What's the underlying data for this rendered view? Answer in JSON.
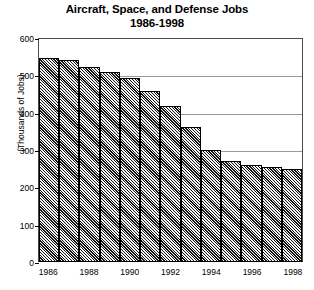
{
  "chart_data": {
    "type": "bar",
    "title": "Aircraft, Space, and Defense Jobs",
    "subtitle": "1986-1998",
    "xlabel": "",
    "ylabel": "(Thousands of Jobs)",
    "ylim": [
      0,
      600
    ],
    "ytick_values": [
      0,
      100,
      200,
      300,
      400,
      500,
      600
    ],
    "ytick_labels": [
      "0",
      "100",
      "200",
      "300",
      "400",
      "500",
      "600"
    ],
    "grid": true,
    "legend": "none",
    "categories": [
      "1986",
      "1987",
      "1988",
      "1989",
      "1990",
      "1991",
      "1992",
      "1993",
      "1994",
      "1995",
      "1996",
      "1997",
      "1998"
    ],
    "xtick_labels_shown": [
      "1986",
      "",
      "1988",
      "",
      "1990",
      "",
      "1992",
      "",
      "1994",
      "",
      "1996",
      "",
      "1998"
    ],
    "values": [
      550,
      542,
      525,
      512,
      495,
      460,
      420,
      363,
      300,
      270,
      260,
      253,
      250
    ],
    "bar_style": "diagonal-hatch",
    "bar_fill_color": "#8e8e8e",
    "bar_edge_color": "#000000",
    "grid_color": "#9a9a9a",
    "background_color": "#ffffff",
    "text_color": "#000000"
  }
}
